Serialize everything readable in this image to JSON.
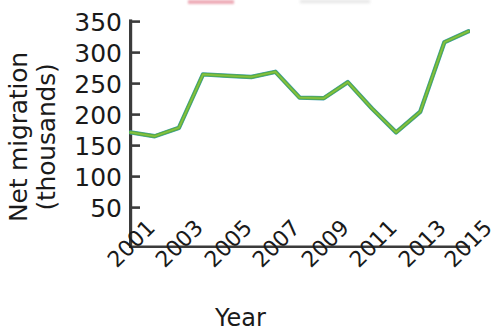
{
  "chart_data": {
    "type": "line",
    "title": "",
    "xlabel": "Year",
    "ylabel": "Net migration (thousands)",
    "ylabel_line1": "Net migration",
    "ylabel_line2": "(thousands)",
    "x": [
      2001,
      2002,
      2003,
      2004,
      2005,
      2006,
      2007,
      2008,
      2009,
      2010,
      2011,
      2012,
      2013,
      2014,
      2015
    ],
    "values": [
      178,
      172,
      185,
      268,
      266,
      264,
      272,
      232,
      231,
      256,
      215,
      178,
      210,
      318,
      335
    ],
    "series": [
      {
        "name": "Net migration",
        "color": "#4aa03c",
        "values": [
          178,
          172,
          185,
          268,
          266,
          264,
          272,
          232,
          231,
          256,
          215,
          178,
          210,
          318,
          335
        ]
      }
    ],
    "xlim": [
      2001,
      2015
    ],
    "ylim": [
      0,
      350
    ],
    "ytick_labels": [
      "350",
      "300",
      "250",
      "200",
      "150",
      "100",
      "50"
    ],
    "ytick_values": [
      350,
      300,
      250,
      200,
      150,
      100,
      50
    ],
    "xtick_labels": [
      "2001",
      "2003",
      "2005",
      "2007",
      "2009",
      "2011",
      "2013",
      "2015"
    ],
    "xtick_values": [
      2001,
      2003,
      2005,
      2007,
      2009,
      2011,
      2013,
      2015
    ],
    "grid": false,
    "legend": "none",
    "line_color_primary": "#4aa03c",
    "line_color_edge": "#3e9fb0",
    "line_color_highlight": "#8dc63f",
    "axis_color": "#3b3b3b",
    "background_color": "#ffffff"
  },
  "figure": {
    "y_axis_title_name": "net-migration-thousands",
    "x_axis_title_name": "year"
  }
}
